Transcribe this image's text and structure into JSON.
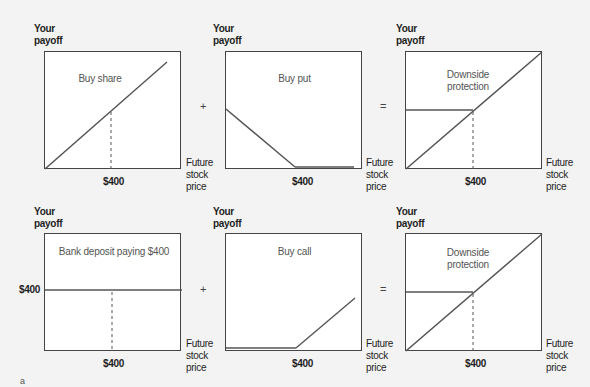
{
  "axis_labels": {
    "y": [
      "Your",
      "payoff"
    ],
    "x": [
      "Future",
      "stock",
      "price"
    ],
    "strike_tick": "$400",
    "y_tick_bank": "$400"
  },
  "operators": {
    "plus": "+",
    "equals": "="
  },
  "rows": [
    {
      "panels": [
        {
          "title": "Buy share",
          "shape": "diagonal"
        },
        {
          "title": "Buy put",
          "shape": "put"
        },
        {
          "title_lines": [
            "Downside",
            "protection"
          ],
          "shape": "protected"
        }
      ]
    },
    {
      "panels": [
        {
          "title": "Bank deposit paying $400",
          "shape": "flat"
        },
        {
          "title": "Buy call",
          "shape": "call"
        },
        {
          "title_lines": [
            "Downside",
            "protection"
          ],
          "shape": "protected"
        }
      ]
    }
  ],
  "footnote_mark": "a"
}
